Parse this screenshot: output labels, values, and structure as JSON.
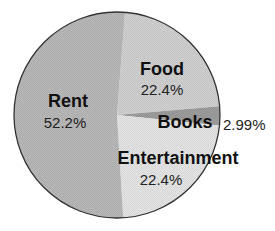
{
  "chart_data": {
    "type": "pie",
    "title": "",
    "categories": [
      "Rent",
      "Food",
      "Books",
      "Entertainment"
    ],
    "values": [
      52.2,
      22.4,
      2.99,
      22.4
    ],
    "labels": [
      "52.2%",
      "22.4%",
      "2.99%",
      "22.4%"
    ],
    "colors": [
      "#b8b8b8",
      "#d0d0d0",
      "#9c9c9c",
      "#e4e4e4"
    ],
    "start_angle_deg_clockwise_from_top": 4.5,
    "direction": "clockwise",
    "slice_order": [
      "Food",
      "Books",
      "Entertainment",
      "Rent"
    ],
    "legend": "none",
    "outline_color": "#333333"
  },
  "slices": {
    "rent": {
      "name": "Rent",
      "pct": "52.2%"
    },
    "food": {
      "name": "Food",
      "pct": "22.4%"
    },
    "books": {
      "name": "Books",
      "pct": "2.99%"
    },
    "entertainment": {
      "name": "Entertainment",
      "pct": "22.4%"
    }
  }
}
